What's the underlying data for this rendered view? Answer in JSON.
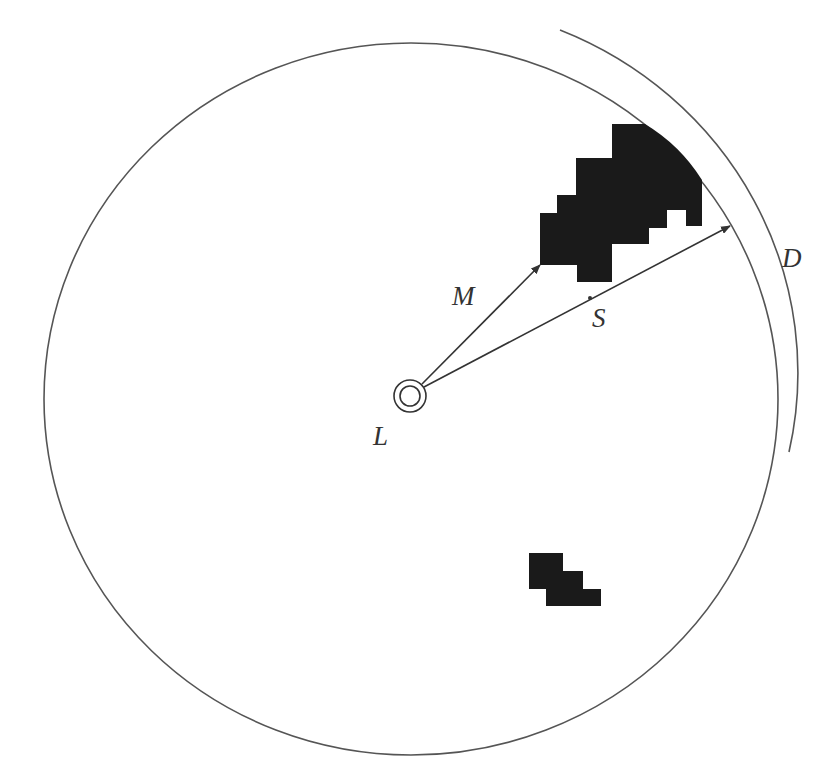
{
  "diagram": {
    "labels": {
      "L": "L",
      "M": "M",
      "S": "S",
      "D": "D"
    },
    "colors": {
      "stroke": "#444444",
      "fill_obstacle": "#1a1a1a",
      "background": "#ffffff"
    },
    "elements": {
      "boundary_circle": "Large circle centered at L",
      "outer_arc": "Arc D outside the circle on upper right",
      "center_marker": "Double circle at L",
      "arrow_M": "Arrow from L to the nearest obstacle corner",
      "arrow_S": "Arrow from L to circle boundary, passing obstacle",
      "obstacle_upper": "Large pixelated black region near top-right boundary",
      "obstacle_lower": "Small pixelated black region below L"
    }
  }
}
